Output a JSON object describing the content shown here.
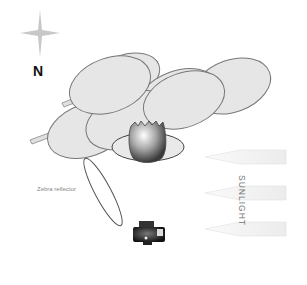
{
  "diagram": {
    "type": "photography-lighting-setup",
    "compass": {
      "label": "N",
      "icon": "compass-star-icon"
    },
    "subject": {
      "description": "cracked egg on oval base",
      "icon": "egg-icon"
    },
    "diffuser": {
      "description": "cluster of leaf-shaped diffusers on stems",
      "count": 7
    },
    "reflector": {
      "label": "Zebra reflector"
    },
    "camera": {
      "icon": "camera-icon"
    },
    "light_source": {
      "label": "SUNLIGHT",
      "arrows": 3,
      "direction": "from right"
    },
    "colors": {
      "leaf_fill": "#e6e6e6",
      "leaf_stroke": "#777777",
      "arrow_fill": "#f4f4f4"
    }
  }
}
